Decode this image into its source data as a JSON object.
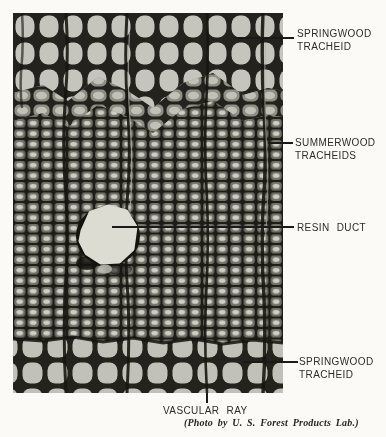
{
  "figure": {
    "labels": {
      "springwood_top": "SPRINGWOOD TRACHEID",
      "summerwood": "SUMMERWOOD TRACHEIDS",
      "resin_duct": "RESIN DUCT",
      "springwood_bottom": "SPRINGWOOD TRACHEID",
      "vascular_ray": "VASCULAR RAY"
    },
    "caption": "(Photo by U. S. Forest Products Lab.)",
    "colors": {
      "paper": "#fbfaf7",
      "ink": "#2d2c29",
      "cell_wall": "#21201a",
      "springwood_lumen": "#c6c5bd",
      "summerwood_body": "#716f66",
      "summerwood_lumen": "#cfcec5",
      "resin_duct_lumen": "#dddcd3"
    }
  }
}
